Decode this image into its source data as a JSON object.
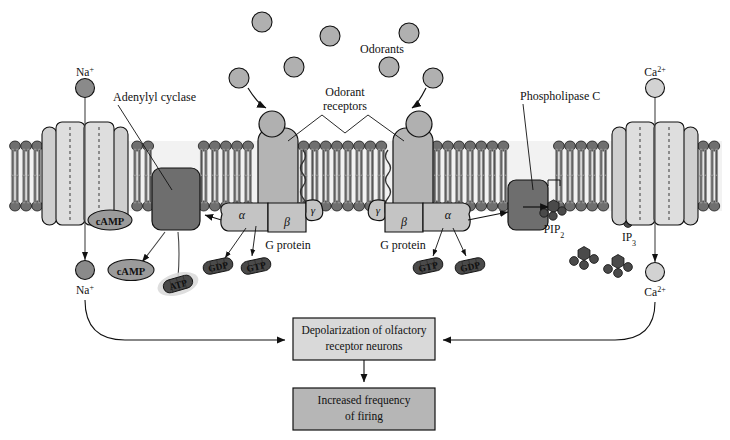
{
  "figure": {
    "type": "diagram",
    "width": 730,
    "height": 440,
    "background": "#ffffff"
  },
  "colors": {
    "membrane_head": "#6f6f6f",
    "membrane_tail": "#8e8e8e",
    "membrane_band": "#9a9a9a",
    "channel_fill": "#cfcfcf",
    "channel_light": "#dcdcdc",
    "receptor_fill": "#b4b4b4",
    "gprotein_fill": "#c4c4c4",
    "enzyme_fill": "#6e6e6e",
    "odorant_fill": "#b0b0b0",
    "na_ion": "#8a8a8a",
    "ca_ion": "#d2d2d2",
    "nucleotide_fill": "#4a4a4a",
    "camp_fill": "#9b9b9b",
    "box_fill_light": "#d9d9d9",
    "box_fill_dark": "#b6b6b6",
    "stroke": "#111111",
    "text": "#111111"
  },
  "labels": {
    "odorants": "Odorants",
    "odorant_receptors_l1": "Odorant",
    "odorant_receptors_l2": "receptors",
    "adenylyl_cyclase": "Adenylyl cyclase",
    "phospholipase_c": "Phospholipase C",
    "g_protein_left": "G protein",
    "g_protein_right": "G protein",
    "na_top": "Na",
    "na_top_sup": "+",
    "na_bottom": "Na",
    "na_bottom_sup": "+",
    "ca_top": "Ca",
    "ca_top_sup": "2+",
    "ca_bottom": "Ca",
    "ca_bottom_sup": "2+",
    "pip2": "PIP",
    "pip2_sub": "2",
    "ip3": "IP",
    "ip3_sub": "3",
    "camp_membrane": "cAMP",
    "camp_free": "cAMP",
    "atp": "ATP",
    "gdp_left": "GDP",
    "gtp_left": "GTP",
    "gtp_right": "GTP",
    "gdp_right": "GDP"
  },
  "gprotein_subunits": {
    "left": {
      "alpha": "α",
      "beta": "β",
      "gamma": "γ"
    },
    "right": {
      "alpha": "α",
      "beta": "β",
      "gamma": "γ"
    }
  },
  "outcome_boxes": [
    {
      "name": "depolarization",
      "line1": "Depolarization of olfactory",
      "line2": "receptor neurons",
      "fill": "#d9d9d9"
    },
    {
      "name": "increased-firing",
      "line1": "Increased frequency",
      "line2": "of firing",
      "fill": "#b6b6b6"
    }
  ],
  "odorant_particles": [
    {
      "cx": 262,
      "cy": 22,
      "r": 10
    },
    {
      "cx": 330,
      "cy": 36,
      "r": 10
    },
    {
      "cx": 409,
      "cy": 33,
      "r": 10
    },
    {
      "cx": 294,
      "cy": 67,
      "r": 10
    },
    {
      "cx": 239,
      "cy": 78,
      "r": 10
    },
    {
      "cx": 389,
      "cy": 67,
      "r": 10
    },
    {
      "cx": 433,
      "cy": 78,
      "r": 10
    }
  ]
}
